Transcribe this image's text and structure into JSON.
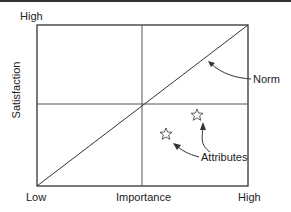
{
  "diagram": {
    "y_axis": {
      "label": "Satisfaction",
      "high": "High"
    },
    "x_axis": {
      "label": "Importance",
      "low": "Low",
      "high": "High"
    },
    "annotations": {
      "norm": "Norm",
      "attributes": "Attributes"
    },
    "markers": [
      {
        "shape": "star",
        "x": 197,
        "y": 115
      },
      {
        "shape": "star",
        "x": 166,
        "y": 134
      }
    ]
  }
}
